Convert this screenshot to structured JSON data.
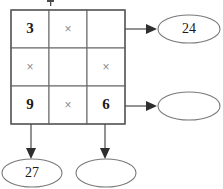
{
  "puzzle": {
    "type": "multiplication-grid",
    "grid": {
      "rows": 3,
      "cols": 3,
      "cells": [
        [
          {
            "id": "r1c1",
            "text": "3",
            "kind": "number",
            "filled": true
          },
          {
            "id": "r1c2",
            "text": "×",
            "kind": "operator",
            "filled": true
          },
          {
            "id": "r1c3",
            "text": "",
            "kind": "blank",
            "filled": false
          }
        ],
        [
          {
            "id": "r2c1",
            "text": "×",
            "kind": "operator",
            "filled": true
          },
          {
            "id": "r2c2",
            "text": "",
            "kind": "blank",
            "filled": false
          },
          {
            "id": "r2c3",
            "text": "×",
            "kind": "operator",
            "filled": true
          }
        ],
        [
          {
            "id": "r3c1",
            "text": "9",
            "kind": "number",
            "filled": true
          },
          {
            "id": "r3c2",
            "text": "×",
            "kind": "operator",
            "filled": true
          },
          {
            "id": "r3c3",
            "text": "6",
            "kind": "number",
            "filled": true
          }
        ]
      ]
    },
    "results": [
      {
        "id": "result-row-1",
        "direction": "right",
        "source": "row-1",
        "text": "24",
        "filled": true
      },
      {
        "id": "result-row-3",
        "direction": "right",
        "source": "row-3",
        "text": "",
        "filled": false
      },
      {
        "id": "result-col-1",
        "direction": "down",
        "source": "column-1",
        "text": "27",
        "filled": true
      },
      {
        "id": "result-col-3",
        "direction": "down",
        "source": "column-3",
        "text": "",
        "filled": false
      }
    ],
    "arrows": [
      {
        "id": "arrow-row-1",
        "from": "row-1",
        "to": "result-row-1",
        "direction": "right"
      },
      {
        "id": "arrow-row-3",
        "from": "row-3",
        "to": "result-row-3",
        "direction": "right"
      },
      {
        "id": "arrow-col-1",
        "from": "column-1",
        "to": "result-col-1",
        "direction": "down"
      },
      {
        "id": "arrow-col-3",
        "from": "column-3",
        "to": "result-col-3",
        "direction": "down"
      }
    ],
    "colors": {
      "grid_border": "#6e6e6e",
      "grid_outer_border": "#5a5a5a",
      "number_text": "#1a1a1a",
      "operator_text": "#8c8c8c",
      "arrow": "#2e2e2e",
      "ellipse_border": "#7a7a7a",
      "background": "#ffffff"
    }
  }
}
